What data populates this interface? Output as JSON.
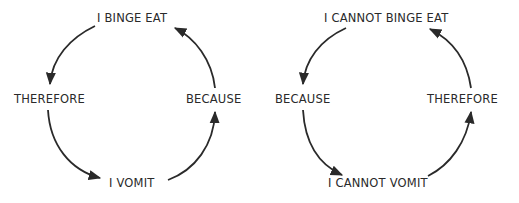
{
  "diagrams": [
    {
      "name": "binge-vomit-cycle",
      "top": "I BINGE EAT",
      "left": "THEREFORE",
      "right": "BECAUSE",
      "bottom": "I VOMIT"
    },
    {
      "name": "cannot-cycle",
      "top": "I CANNOT BINGE EAT",
      "left": "BECAUSE",
      "right": "THEREFORE",
      "bottom": "I CANNOT VOMIT"
    }
  ],
  "colors": {
    "stroke": "#2a2a2a",
    "text": "#2a2a2a",
    "background": "#ffffff"
  }
}
